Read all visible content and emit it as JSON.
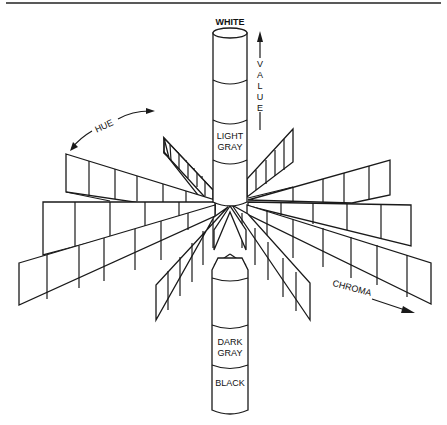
{
  "diagram": {
    "labels": {
      "white": "WHITE",
      "light_gray_1": "LIGHT",
      "light_gray_2": "GRAY",
      "dark_gray_1": "DARK",
      "dark_gray_2": "GRAY",
      "black": "BLACK",
      "hue": "HUE",
      "chroma": "CHROMA",
      "value_letters": [
        "V",
        "A",
        "L",
        "U",
        "E"
      ]
    },
    "axes": {
      "value": {
        "label": "VALUE",
        "direction": "up",
        "from": "BLACK",
        "to": "WHITE"
      },
      "hue": {
        "label": "HUE",
        "direction": "circular"
      },
      "chroma": {
        "label": "CHROMA",
        "direction": "outward"
      }
    },
    "cylinder_segments": [
      "WHITE",
      "",
      "LIGHT GRAY",
      "",
      "",
      "DARK GRAY",
      "BLACK"
    ],
    "colors": {
      "stroke": "#1a1a1a",
      "background": "#ffffff"
    }
  }
}
